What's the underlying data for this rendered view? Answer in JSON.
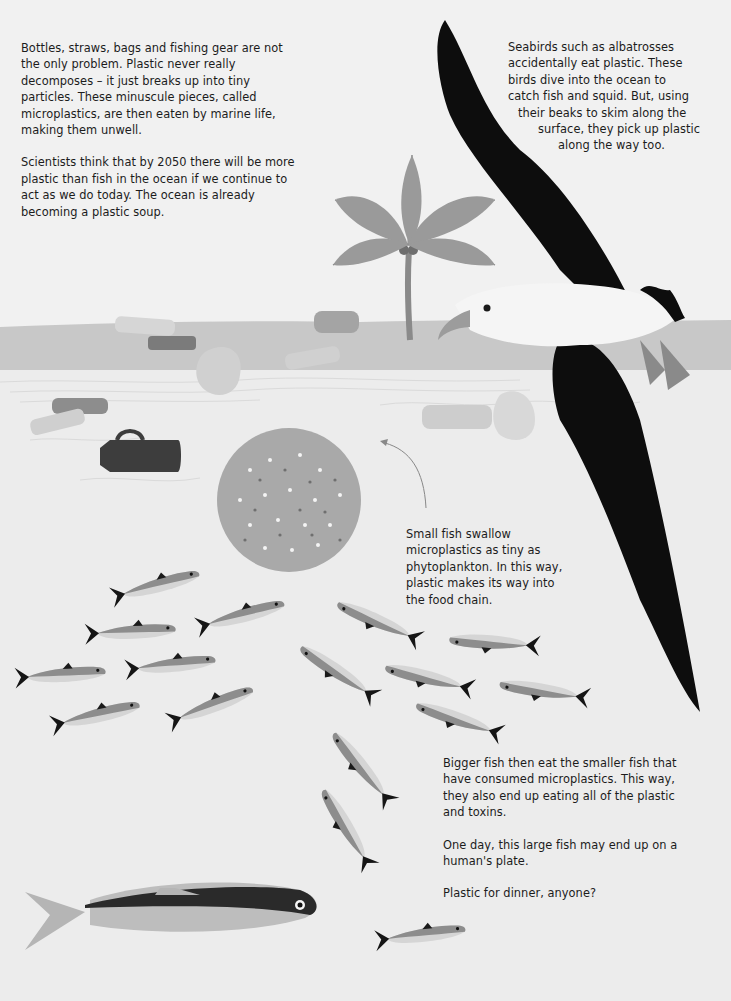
{
  "intro": {
    "paragraphs": [
      "Bottles, straws, bags and fishing gear are not the only problem. Plastic never really decomposes – it just breaks up into tiny particles. These minuscule pieces, called microplastics, are then eaten by marine life, making them unwell.",
      "Scientists think that by 2050 there will be more plastic than fish in the ocean if we continue to act as we do today. The ocean is already becoming a plastic soup."
    ]
  },
  "seabirds": {
    "lines": [
      "Seabirds such as albatrosses",
      "accidentally eat plastic. These",
      "birds dive into the ocean to",
      "catch fish and squid. But, using",
      "their beaks to skim along the",
      "surface, they pick up plastic",
      "along the way too."
    ]
  },
  "small_fish": {
    "text": "Small fish swallow microplastics as tiny as phytoplankton. In this way, plastic makes its way into the food chain."
  },
  "bigger_fish": {
    "paragraphs": [
      "Bigger fish then eat the smaller fish that have consumed microplastics. This way, they also end up eating all of the plastic and toxins.",
      "One day, this large fish may end up on a human's plate.",
      "Plastic for dinner, anyone?"
    ]
  },
  "colors": {
    "background": "#f1f1f1",
    "sea_band": "#c9c9c9",
    "water": "#e8e8e8",
    "albatross_wing": "#0d0d0d",
    "fish_body": "#8f8f8f",
    "text": "#1c1c1c"
  }
}
